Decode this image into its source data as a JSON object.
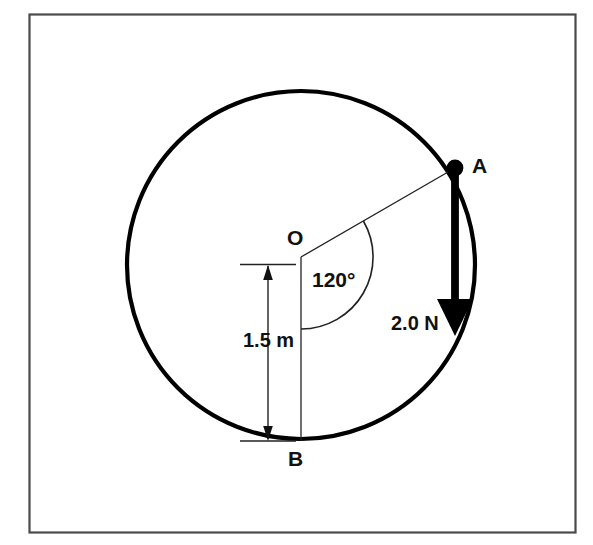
{
  "figure": {
    "frame": {
      "name": "outer-border",
      "stroke_color": "#4a4a4a",
      "background_color": "#ffffff"
    },
    "circle": {
      "name": "main-circle",
      "center_label": "O",
      "cx": 301,
      "cy": 265,
      "r": 174,
      "stroke_color": "#000000",
      "stroke_width": 4.2
    },
    "points": [
      {
        "id": "A",
        "label": "A",
        "x": 455,
        "y": 168,
        "marker": "filled-dot"
      },
      {
        "id": "O",
        "label": "O",
        "x": 301,
        "y": 257,
        "marker": "none"
      },
      {
        "id": "B",
        "label": "B",
        "x": 301,
        "y": 440,
        "marker": "none"
      }
    ],
    "angle": {
      "label": "120°",
      "value": 120,
      "unit": "degrees",
      "vertex": "O",
      "from_ray": "OB",
      "to_ray": "OA",
      "arc_radius": 72
    },
    "force": {
      "label": "2.0 N",
      "magnitude": 2.0,
      "unit": "N",
      "direction": "down",
      "applied_at": "A",
      "arrow_color": "#000000"
    },
    "dimension": {
      "label": "1.5 m",
      "value": 1.5,
      "unit": "m",
      "from": "O",
      "to": "B",
      "style": "double-arrow"
    },
    "lines": [
      {
        "name": "radius-OA",
        "from": "O",
        "to": "A",
        "style": "thin"
      },
      {
        "name": "radius-OB",
        "from": "O",
        "to": "B",
        "style": "thin"
      }
    ]
  }
}
